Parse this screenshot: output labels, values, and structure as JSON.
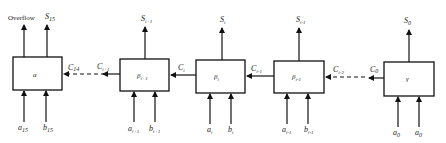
{
  "diagram": {
    "type": "ripple-carry adder block diagram",
    "outputs_top": [
      {
        "id": "overflow",
        "label": "Overflow"
      },
      {
        "id": "s15",
        "label": "S",
        "sub": "15"
      },
      {
        "id": "si1",
        "label": "S",
        "sub": "i+1"
      },
      {
        "id": "si",
        "label": "S",
        "sub": "i"
      },
      {
        "id": "sim1",
        "label": "S",
        "sub": "i-1"
      },
      {
        "id": "s0",
        "label": "S",
        "sub": "0"
      }
    ],
    "blocks": [
      {
        "id": "block-alpha",
        "label": "α",
        "sub": ""
      },
      {
        "id": "block-beta-i1",
        "label": "β",
        "sub": "i+1"
      },
      {
        "id": "block-beta-i",
        "label": "β",
        "sub": "i"
      },
      {
        "id": "block-beta-im1",
        "label": "β",
        "sub": "i-1"
      },
      {
        "id": "block-gamma",
        "label": "γ",
        "sub": ""
      }
    ],
    "carries": [
      {
        "id": "c14",
        "label": "C",
        "sub": "14"
      },
      {
        "id": "ci1",
        "label": "C",
        "sub": "i+1"
      },
      {
        "id": "ci",
        "label": "C",
        "sub": "i"
      },
      {
        "id": "cim1",
        "label": "C",
        "sub": "i-1"
      },
      {
        "id": "cim2",
        "label": "C",
        "sub": "i-2"
      },
      {
        "id": "c0",
        "label": "C",
        "sub": "0"
      }
    ],
    "inputs_bottom": [
      {
        "id": "a15",
        "label": "a",
        "sub": "15"
      },
      {
        "id": "b15",
        "label": "b",
        "sub": "15"
      },
      {
        "id": "ai1",
        "label": "a",
        "sub": "i+1"
      },
      {
        "id": "bi1",
        "label": "b",
        "sub": "i+1"
      },
      {
        "id": "ai",
        "label": "a",
        "sub": "i"
      },
      {
        "id": "bi",
        "label": "b",
        "sub": "i"
      },
      {
        "id": "aim1",
        "label": "a",
        "sub": "i-1"
      },
      {
        "id": "bim1",
        "label": "b",
        "sub": "i-1"
      },
      {
        "id": "a0",
        "label": "a",
        "sub": "0"
      },
      {
        "id": "a0b",
        "label": "a",
        "sub": "0"
      }
    ]
  }
}
